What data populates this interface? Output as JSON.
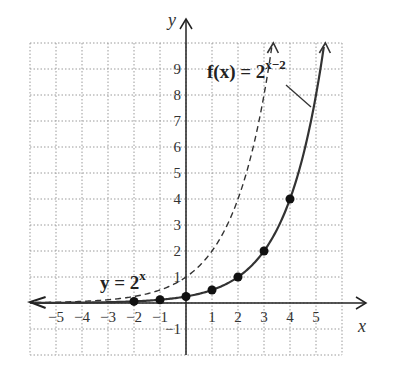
{
  "chart_data": {
    "type": "line",
    "title": "",
    "xlabel": "x",
    "ylabel": "y",
    "xlim": [
      -6,
      6
    ],
    "ylim": [
      -2,
      10
    ],
    "grid": true,
    "x_ticks": [
      "-5",
      "-4",
      "-3",
      "-2",
      "-1",
      "1",
      "2",
      "3",
      "4",
      "5"
    ],
    "y_ticks": [
      "-1",
      "1",
      "2",
      "3",
      "4",
      "5",
      "6",
      "7",
      "8",
      "9"
    ],
    "series": [
      {
        "name": "y = 2^x",
        "style": "dashed",
        "label_base": "y = 2",
        "label_exp": "x",
        "x": [
          -6,
          -5,
          -4,
          -3,
          -2,
          -1,
          0,
          1,
          2,
          3,
          3.32
        ],
        "y": [
          0.016,
          0.031,
          0.063,
          0.125,
          0.25,
          0.5,
          1,
          2,
          4,
          8,
          10
        ]
      },
      {
        "name": "f(x) = 2^(x-2)",
        "style": "solid",
        "label_base": "f(x) = 2",
        "label_exp": "x−2",
        "x": [
          -6,
          -5,
          -4,
          -3,
          -2,
          -1,
          0,
          1,
          2,
          3,
          4,
          5,
          5.32
        ],
        "y": [
          0.004,
          0.008,
          0.016,
          0.031,
          0.0625,
          0.125,
          0.25,
          0.5,
          1,
          2,
          4,
          8,
          10
        ],
        "points": [
          {
            "x": -2,
            "y": 0.0625
          },
          {
            "x": -1,
            "y": 0.125
          },
          {
            "x": 0,
            "y": 0.25
          },
          {
            "x": 1,
            "y": 0.5
          },
          {
            "x": 2,
            "y": 1
          },
          {
            "x": 3,
            "y": 2
          },
          {
            "x": 4,
            "y": 4
          }
        ]
      }
    ]
  }
}
